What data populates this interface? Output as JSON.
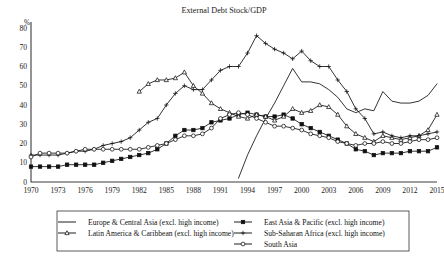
{
  "chart_data": {
    "type": "line",
    "title": "External Debt Stock/GDP",
    "xlabel": "",
    "ylabel": "%",
    "ylim": [
      0,
      80
    ],
    "xlim": [
      1970,
      2015
    ],
    "grid": false,
    "legend_position": "bottom",
    "y_ticks": [
      0,
      10,
      20,
      30,
      40,
      50,
      60,
      70,
      80
    ],
    "x_ticks": [
      1970,
      1973,
      1976,
      1979,
      1982,
      1985,
      1988,
      1991,
      1994,
      1997,
      2000,
      2003,
      2006,
      2009,
      2012,
      2015
    ],
    "x": [
      1970,
      1971,
      1972,
      1973,
      1974,
      1975,
      1976,
      1977,
      1978,
      1979,
      1980,
      1981,
      1982,
      1983,
      1984,
      1985,
      1986,
      1987,
      1988,
      1989,
      1990,
      1991,
      1992,
      1993,
      1994,
      1995,
      1996,
      1997,
      1998,
      1999,
      2000,
      2001,
      2002,
      2003,
      2004,
      2005,
      2006,
      2007,
      2008,
      2009,
      2010,
      2011,
      2012,
      2013,
      2014,
      2015
    ],
    "series": [
      {
        "name": "Europe & Central Asia (excl. high income)",
        "marker": "none",
        "x": [
          1993,
          1994,
          1995,
          1996,
          1997,
          1998,
          1999,
          2000,
          2001,
          2002,
          2003,
          2004,
          2005,
          2006,
          2007,
          2008,
          2009,
          2010,
          2011,
          2012,
          2013,
          2014,
          2015
        ],
        "values": [
          2,
          14,
          24,
          33,
          41,
          50,
          59,
          52,
          52,
          51,
          48,
          44,
          38,
          36,
          38,
          37,
          47,
          42,
          41,
          41,
          42,
          45,
          51
        ]
      },
      {
        "name": "East Asia & Pacific (excl. high income)",
        "marker": "square-solid",
        "x": [
          1970,
          1971,
          1972,
          1973,
          1974,
          1975,
          1976,
          1977,
          1978,
          1979,
          1980,
          1981,
          1982,
          1983,
          1984,
          1985,
          1986,
          1987,
          1988,
          1989,
          1990,
          1991,
          1992,
          1993,
          1994,
          1995,
          1996,
          1997,
          1998,
          1999,
          2000,
          2001,
          2002,
          2003,
          2004,
          2005,
          2006,
          2007,
          2008,
          2009,
          2010,
          2011,
          2012,
          2013,
          2014,
          2015
        ],
        "values": [
          8,
          8,
          8,
          8,
          9,
          9,
          9,
          9,
          10,
          11,
          12,
          13,
          14,
          15,
          17,
          20,
          24,
          27,
          27,
          28,
          31,
          32,
          33,
          35,
          36,
          35,
          34,
          34,
          35,
          33,
          30,
          28,
          26,
          24,
          22,
          20,
          17,
          16,
          14,
          15,
          15,
          15,
          16,
          16,
          16,
          18
        ]
      },
      {
        "name": "Latin America & Caribbean (excl. high income)",
        "marker": "triangle-open",
        "x": [
          1982,
          1983,
          1984,
          1985,
          1986,
          1987,
          1988,
          1989,
          1990,
          1991,
          1992,
          1993,
          1994,
          1995,
          1996,
          1997,
          1998,
          1999,
          2000,
          2001,
          2002,
          2003,
          2004,
          2005,
          2006,
          2007,
          2008,
          2009,
          2010,
          2011,
          2012,
          2013,
          2014,
          2015
        ],
        "values": [
          47,
          51,
          53,
          53,
          54,
          57,
          50,
          46,
          41,
          38,
          36,
          34,
          33,
          35,
          34,
          32,
          34,
          38,
          36,
          37,
          40,
          39,
          35,
          29,
          25,
          23,
          21,
          24,
          23,
          22,
          23,
          24,
          27,
          35
        ]
      },
      {
        "name": "Sub-Saharan Africa (excl. high income)",
        "marker": "plus",
        "x": [
          1970,
          1971,
          1972,
          1973,
          1974,
          1975,
          1976,
          1977,
          1978,
          1979,
          1980,
          1981,
          1982,
          1983,
          1984,
          1985,
          1986,
          1987,
          1988,
          1989,
          1990,
          1991,
          1992,
          1993,
          1994,
          1995,
          1996,
          1997,
          1998,
          1999,
          2000,
          2001,
          2002,
          2003,
          2004,
          2005,
          2006,
          2007,
          2008,
          2009,
          2010,
          2011,
          2012,
          2013,
          2014,
          2015
        ],
        "values": [
          14,
          14,
          14,
          14,
          15,
          16,
          16,
          17,
          19,
          20,
          21,
          23,
          27,
          31,
          33,
          40,
          46,
          50,
          48,
          48,
          53,
          58,
          60,
          60,
          67,
          76,
          72,
          69,
          67,
          64,
          68,
          63,
          60,
          60,
          53,
          47,
          38,
          33,
          25,
          26,
          24,
          23,
          24,
          24,
          25,
          26
        ]
      },
      {
        "name": "South Asia",
        "marker": "circle-open",
        "x": [
          1970,
          1971,
          1972,
          1973,
          1974,
          1975,
          1976,
          1977,
          1978,
          1979,
          1980,
          1981,
          1982,
          1983,
          1984,
          1985,
          1986,
          1987,
          1988,
          1989,
          1990,
          1991,
          1992,
          1993,
          1994,
          1995,
          1996,
          1997,
          1998,
          1999,
          2000,
          2001,
          2002,
          2003,
          2004,
          2005,
          2006,
          2007,
          2008,
          2009,
          2010,
          2011,
          2012,
          2013,
          2014,
          2015
        ],
        "values": [
          13,
          15,
          15,
          15,
          15,
          16,
          17,
          17,
          17,
          17,
          17,
          17,
          17,
          18,
          19,
          20,
          22,
          24,
          24,
          25,
          28,
          33,
          35,
          36,
          35,
          33,
          31,
          29,
          29,
          28,
          27,
          25,
          24,
          23,
          21,
          20,
          19,
          20,
          20,
          21,
          20,
          20,
          21,
          22,
          22,
          23
        ]
      }
    ]
  },
  "legend": {
    "entries": [
      {
        "label": "Europe & Central Asia (excl. high income)",
        "marker": "none"
      },
      {
        "label": "East Asia & Pacific (excl. high income)",
        "marker": "square-solid"
      },
      {
        "label": "Latin America & Caribbean (excl. high income)",
        "marker": "triangle-open"
      },
      {
        "label": "Sub-Saharan Africa (excl. high income)",
        "marker": "plus"
      },
      {
        "label": "South Asia",
        "marker": "circle-open"
      }
    ]
  },
  "colors": {
    "ink": "#111111",
    "axis": "#3d3d3d",
    "background": "#ffffff"
  }
}
